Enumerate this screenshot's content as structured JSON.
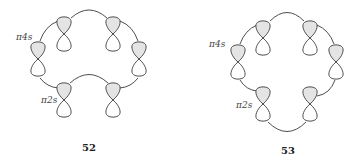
{
  "figures": [
    {
      "id": "52",
      "caption": "52",
      "labels": {
        "upper": "π4s",
        "lower": "π2s"
      },
      "description": "Möbius-like array of six p-orbitals: two inner orbitals connected by a concave inner arc (bridged topology)"
    },
    {
      "id": "53",
      "caption": "53",
      "labels": {
        "upper": "π4s",
        "lower": "π2s"
      },
      "description": "Hückel-like cyclic array of six p-orbitals connected in a closed ring"
    }
  ],
  "colors": {
    "line": "#3a3a3a",
    "shaded_lobe": "#e4e4e4",
    "open_lobe": "#ffffff"
  }
}
